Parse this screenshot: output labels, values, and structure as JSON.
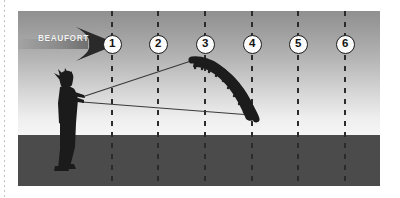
{
  "figure": {
    "name": "beaufort-kite-scale",
    "wind_label": "BEAUFORT",
    "scale_markers": [
      {
        "label": "1",
        "x": 94,
        "y": 33
      },
      {
        "label": "2",
        "x": 140,
        "y": 33
      },
      {
        "label": "3",
        "x": 187,
        "y": 33
      },
      {
        "label": "4",
        "x": 234,
        "y": 33
      },
      {
        "label": "5",
        "x": 280,
        "y": 33
      },
      {
        "label": "6",
        "x": 327,
        "y": 33
      }
    ],
    "scale_lines_x": [
      94,
      140,
      187,
      234,
      280,
      327
    ],
    "colors": {
      "sky_top": "#909090",
      "sky_bottom": "#f6f6f6",
      "ground": "#4b4b4b",
      "kite": "#1b1b1b",
      "figure": "#1b1b1b",
      "arrow": "#8f8f8f",
      "marker_fill": "#fbfbfb",
      "marker_stroke": "#1c1c1c",
      "label_text": "#f4f4f4",
      "dash_line": "#2b2b2b"
    },
    "horizon_y": 124,
    "kite": {
      "name": "power-kite",
      "top_tip": [
        175,
        46
      ],
      "bottom_tip": [
        232,
        105
      ]
    },
    "person": {
      "name": "kite-flyer-silhouette",
      "position": [
        38,
        66
      ]
    },
    "lines": [
      {
        "name": "upper-control-line",
        "from": [
          64,
          85
        ],
        "to": [
          176,
          48
        ]
      },
      {
        "name": "lower-control-line",
        "from": [
          64,
          90
        ],
        "to": [
          232,
          104
        ]
      }
    ]
  }
}
